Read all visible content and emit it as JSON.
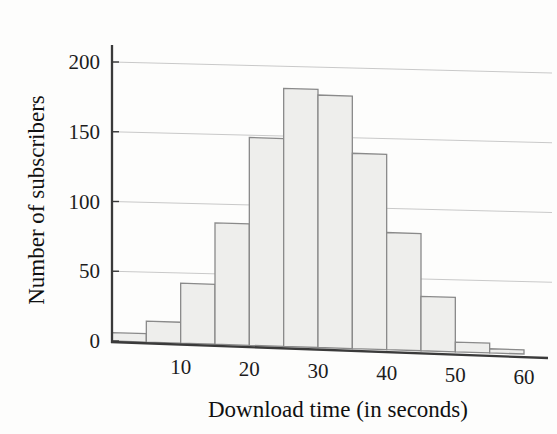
{
  "chart_data": {
    "type": "bar",
    "title": "",
    "subtitle": "",
    "xlabel": "Download time (in seconds)",
    "ylabel": "Number of subscribers",
    "categories": [
      "0-5",
      "5-10",
      "10-15",
      "15-20",
      "20-25",
      "25-30",
      "30-35",
      "35-40",
      "40-45",
      "45-50",
      "50-55",
      "55-60"
    ],
    "bin_starts": [
      0,
      5,
      10,
      15,
      20,
      25,
      30,
      35,
      40,
      45,
      50,
      55
    ],
    "bin_ends": [
      5,
      10,
      15,
      20,
      25,
      30,
      35,
      40,
      45,
      50,
      55,
      60
    ],
    "bin_width": 5,
    "values": [
      6,
      15,
      43,
      87,
      149,
      185,
      181,
      140,
      84,
      39,
      7,
      3
    ],
    "xlim": [
      0,
      60
    ],
    "ylim": [
      0,
      200
    ],
    "xticks": [
      10,
      20,
      30,
      40,
      50,
      60
    ],
    "yticks": [
      0,
      50,
      100,
      150,
      200
    ],
    "xtick_labels": [
      "10",
      "20",
      "30",
      "40",
      "50",
      "60"
    ],
    "ytick_labels": [
      "0",
      "50",
      "100",
      "150",
      "200"
    ],
    "grid": "horizontal",
    "legend": "none",
    "bar_fill": "#eeeeec",
    "bar_stroke": "#8a8a8a",
    "axis_color": "#3a3a3a",
    "grid_color": "#c9c9c9"
  },
  "axes": {
    "x_title": "Download time (in seconds)",
    "y_title": "Number of subscribers"
  }
}
